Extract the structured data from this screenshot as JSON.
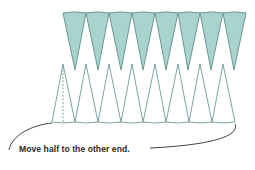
{
  "diagram": {
    "caption": "Move half to the other end.",
    "colors": {
      "sector_fill": "#a9d4ce",
      "sector_stroke": "#5f8f8b",
      "outline_stroke": "#6a9c98",
      "curve_stroke": "#2b2b2b",
      "dashed_line": "#6a9c98"
    },
    "top_row": {
      "count": 8,
      "filled": true,
      "top_y": 12,
      "tip_y": 70,
      "edges_x": [
        63,
        86,
        109,
        132,
        155,
        178,
        200,
        223,
        246
      ],
      "tips_x": [
        75,
        98,
        121,
        143,
        166,
        188,
        211,
        234
      ]
    },
    "bottom_row": {
      "count": 8,
      "filled": false,
      "apex_y": 64,
      "base_y": 122,
      "apex_x": [
        63,
        86,
        109,
        132,
        155,
        178,
        200,
        223
      ],
      "base_x": [
        52,
        75,
        98,
        121,
        143,
        166,
        189,
        212,
        235
      ],
      "half_sector_divider_x": 63
    }
  }
}
